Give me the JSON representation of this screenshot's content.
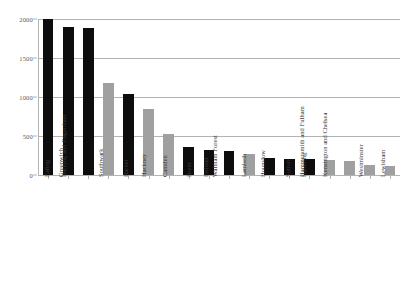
{
  "chart_data": {
    "type": "bar",
    "title": "",
    "subtitle": "",
    "xlabel": "",
    "ylabel": "",
    "ylim": [
      0,
      2000
    ],
    "yticks": [
      0,
      500,
      1000,
      1500,
      2000
    ],
    "ytick_labels": [
      "0",
      "500",
      "1000",
      "1500",
      "2000"
    ],
    "grid": true,
    "legend": "none",
    "colors": {
      "black": "#0d0d0d",
      "gray": "#a0a0a0",
      "gridline": "#b3b3b3",
      "background": "#ffffff",
      "tick_label": "#5a5a5a",
      "category_label": "#3a3a3a"
    },
    "categories": [
      "Ealing",
      "Greenwich",
      "Barking and Dagenham",
      "Southwark",
      "Barnet",
      "Hackney",
      "Camden",
      "Brent",
      "Enfield",
      "Waltham Forest",
      "Lambeth",
      "Hounslow",
      "Sutton",
      "Havering",
      "Hammersmith and Fulham",
      "Kensington and Chelsea",
      "Westminster",
      "Lewisham"
    ],
    "values": [
      2000,
      1900,
      1880,
      1180,
      1045,
      840,
      530,
      360,
      320,
      305,
      265,
      215,
      210,
      205,
      195,
      185,
      130,
      110
    ],
    "bar_colors": [
      "black",
      "black",
      "black",
      "gray",
      "black",
      "gray",
      "gray",
      "black",
      "black",
      "black",
      "gray",
      "black",
      "black",
      "black",
      "gray",
      "gray",
      "gray",
      "gray"
    ]
  }
}
